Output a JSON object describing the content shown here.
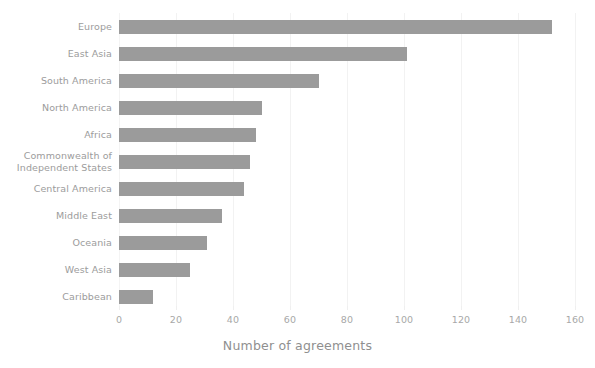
{
  "chart_data": {
    "type": "bar",
    "orientation": "horizontal",
    "title": "",
    "xlabel": "Number of agreements",
    "ylabel": "",
    "xlim": [
      0,
      160
    ],
    "xticks": [
      0,
      20,
      40,
      60,
      80,
      100,
      120,
      140,
      160
    ],
    "xtick_labels": [
      "0",
      "20",
      "40",
      "60",
      "80",
      "100",
      "120",
      "140",
      "160"
    ],
    "grid": true,
    "grid_axis": "x",
    "legend": false,
    "categories": [
      "Europe",
      "East Asia",
      "South America",
      "North America",
      "Africa",
      "Commonwealth of\nIndependent States",
      "Central America",
      "Middle East",
      "Oceania",
      "West Asia",
      "Caribbean"
    ],
    "values": [
      152,
      101,
      70,
      50,
      48,
      46,
      44,
      36,
      31,
      25,
      12
    ],
    "bar_color": "#9b9b9b",
    "background_color": "#ffffff",
    "grid_color": "#f2f2f2",
    "tick_label_color": "#a8a8a8",
    "axis_title_color": "#8f8f8f"
  }
}
